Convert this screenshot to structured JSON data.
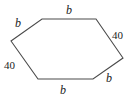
{
  "figure": {
    "type": "hexagon-diagram",
    "shape_name": "hexagon",
    "stroke_color": "#4a4a4a",
    "fill_color": "#ffffff",
    "background_color": "#ffffff",
    "vertices": [
      {
        "name": "left",
        "x": 11,
        "y": 41
      },
      {
        "name": "top-left",
        "x": 42,
        "y": 19
      },
      {
        "name": "top-right",
        "x": 96,
        "y": 19
      },
      {
        "name": "right",
        "x": 123,
        "y": 58
      },
      {
        "name": "bottom-right",
        "x": 93,
        "y": 79
      },
      {
        "name": "bottom-left",
        "x": 38,
        "y": 79
      }
    ],
    "labels": [
      {
        "id": "top-left",
        "text": "b",
        "style": "italic"
      },
      {
        "id": "top",
        "text": "b",
        "style": "italic"
      },
      {
        "id": "right",
        "text": "40",
        "style": "upright"
      },
      {
        "id": "bottom-right",
        "text": "b",
        "style": "italic"
      },
      {
        "id": "bottom",
        "text": "b",
        "style": "italic"
      },
      {
        "id": "left",
        "text": "40",
        "style": "upright"
      }
    ]
  }
}
